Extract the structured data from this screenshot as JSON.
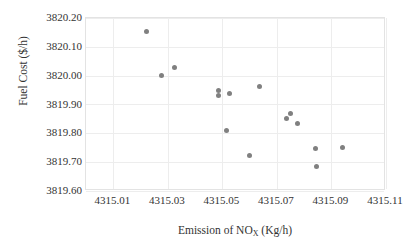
{
  "chart_data": {
    "type": "scatter",
    "title": "",
    "xlabel": "Emission of NOX (Kg/h)",
    "xlabel_prefix": "Emission of NO",
    "xlabel_subscript": "X",
    "xlabel_suffix": " (Kg/h)",
    "ylabel": "Fuel Cost ($/h)",
    "xlim": [
      4315.0,
      4315.11
    ],
    "ylim": [
      3819.6,
      3820.2
    ],
    "xticks": [
      "4315.01",
      "4315.03",
      "4315.05",
      "4315.07",
      "4315.09",
      "4315.11"
    ],
    "xtick_values": [
      4315.01,
      4315.03,
      4315.05,
      4315.07,
      4315.09,
      4315.11
    ],
    "yticks": [
      "3819.60",
      "3819.70",
      "3819.80",
      "3819.90",
      "3820.00",
      "3820.10",
      "3820.20"
    ],
    "ytick_values": [
      3819.6,
      3819.7,
      3819.8,
      3819.9,
      3820.0,
      3820.1,
      3820.2
    ],
    "grid": true,
    "legend": false,
    "marker_color": "#808080",
    "marker_shape": "circle",
    "series": [
      {
        "name": "Pareto front",
        "points": [
          {
            "x": 4315.022,
            "y": 3820.153
          },
          {
            "x": 4315.0275,
            "y": 3819.9995
          },
          {
            "x": 4315.0325,
            "y": 3820.028
          },
          {
            "x": 4315.0485,
            "y": 3819.95
          },
          {
            "x": 4315.0487,
            "y": 3819.9305
          },
          {
            "x": 4315.0525,
            "y": 3819.939
          },
          {
            "x": 4315.0515,
            "y": 3819.811
          },
          {
            "x": 4315.06,
            "y": 3819.722
          },
          {
            "x": 4315.0635,
            "y": 3819.9625
          },
          {
            "x": 4315.0735,
            "y": 3819.8505
          },
          {
            "x": 4315.075,
            "y": 3819.87
          },
          {
            "x": 4315.0775,
            "y": 3819.833
          },
          {
            "x": 4315.084,
            "y": 3819.746
          },
          {
            "x": 4315.0845,
            "y": 3819.684
          },
          {
            "x": 4315.094,
            "y": 3819.7515
          }
        ]
      }
    ]
  }
}
